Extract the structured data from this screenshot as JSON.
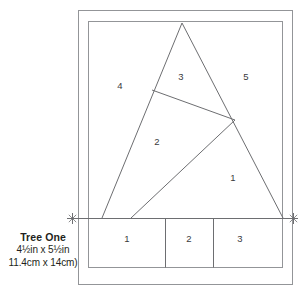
{
  "caption": {
    "title": "Tree One",
    "size_imperial": "4½in x 5½in",
    "size_metric": "11.4cm x 14cm)"
  },
  "diagram": {
    "name": "paper-pieced-tree-block-diagram",
    "stroke_color": "#6d6e71",
    "outer_frame_color": "#939598",
    "label_color": "#3a3a3c",
    "background": "#ffffff",
    "markers": [
      {
        "name": "seam-marker-left",
        "glyph": "✲",
        "x": 72,
        "y": 218
      },
      {
        "name": "seam-marker-right",
        "glyph": "✲",
        "x": 293,
        "y": 218
      }
    ],
    "upper_section_labels": [
      {
        "text": "4",
        "x": 120,
        "y": 86
      },
      {
        "text": "3",
        "x": 181,
        "y": 77
      },
      {
        "text": "5",
        "x": 246,
        "y": 77
      },
      {
        "text": "2",
        "x": 157,
        "y": 142
      },
      {
        "text": "1",
        "x": 233,
        "y": 178
      }
    ],
    "lower_section_labels": [
      {
        "text": "1",
        "x": 127,
        "y": 239
      },
      {
        "text": "2",
        "x": 189,
        "y": 239
      },
      {
        "text": "3",
        "x": 240,
        "y": 239
      }
    ],
    "outer_frame": {
      "x": 78,
      "y": 10,
      "width": 215,
      "height": 275
    },
    "inner_frame": {
      "x": 88,
      "y": 21,
      "width": 195,
      "height": 247
    },
    "baseline_y": 218,
    "lower_dividers_x": [
      165,
      213
    ],
    "triangle": {
      "apex": [
        182,
        23
      ],
      "base_left": [
        102,
        218
      ],
      "base_right": [
        283,
        218
      ]
    },
    "inner_vertices": {
      "left_node": [
        152,
        90
      ],
      "right_node": [
        235,
        120
      ],
      "base_node": [
        131,
        218
      ]
    }
  }
}
